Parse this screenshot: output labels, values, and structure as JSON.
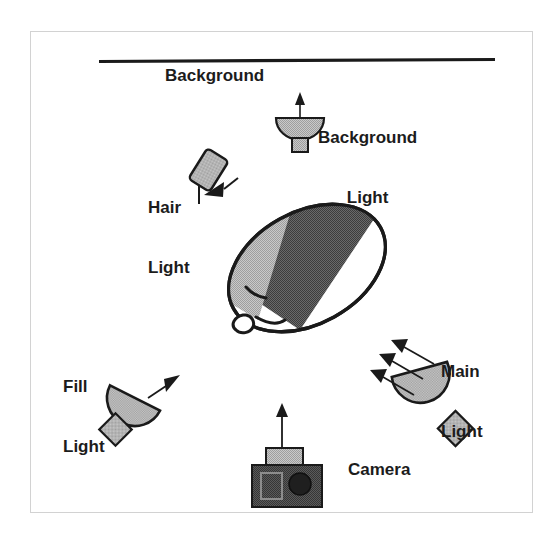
{
  "figure": {
    "frame": {
      "border_color": "#d2d2d2"
    },
    "background_plane": {
      "label": "Background",
      "line_color": "#1a1a1a"
    },
    "labels": {
      "background": "Background",
      "background_light_line1": "Background",
      "background_light_line2": "Light",
      "hair_light_line1": "Hair",
      "hair_light_line2": "Light",
      "main_light_line1": "Main",
      "main_light_line2": "Light",
      "fill_light_line1": "Fill",
      "fill_light_line2": "Light",
      "camera": "Camera"
    },
    "colors": {
      "outline": "#1a1a1a",
      "light_gray_fill": "#b8b8b8",
      "mid_gray_fill": "#a8a8a8",
      "dark_gray_fill": "#565656",
      "camera_body": "#4d4d4d",
      "camera_top": "#a8a8a8",
      "camera_lens": "#262626",
      "paper_white": "#ffffff"
    },
    "elements": [
      {
        "name": "background-light",
        "label": "Background Light",
        "type": "bowl-light",
        "beam_arrows": 1,
        "beam_direction": "up"
      },
      {
        "name": "hair-light",
        "label": "Hair Light",
        "type": "rect-light",
        "beam_arrows": 1,
        "beam_direction": "down-left"
      },
      {
        "name": "main-light",
        "label": "Main Light",
        "type": "bowl-light",
        "beam_arrows": 3,
        "beam_direction": "up-left"
      },
      {
        "name": "fill-light",
        "label": "Fill Light",
        "type": "bowl-light",
        "beam_arrows": 1,
        "beam_direction": "up-right"
      },
      {
        "name": "camera",
        "label": "Camera",
        "type": "camera",
        "beam_arrows": 1,
        "beam_direction": "up"
      },
      {
        "name": "subject-head",
        "label": "",
        "type": "head",
        "shading_zones": [
          "dark-gray",
          "light-gray",
          "white"
        ]
      }
    ]
  }
}
